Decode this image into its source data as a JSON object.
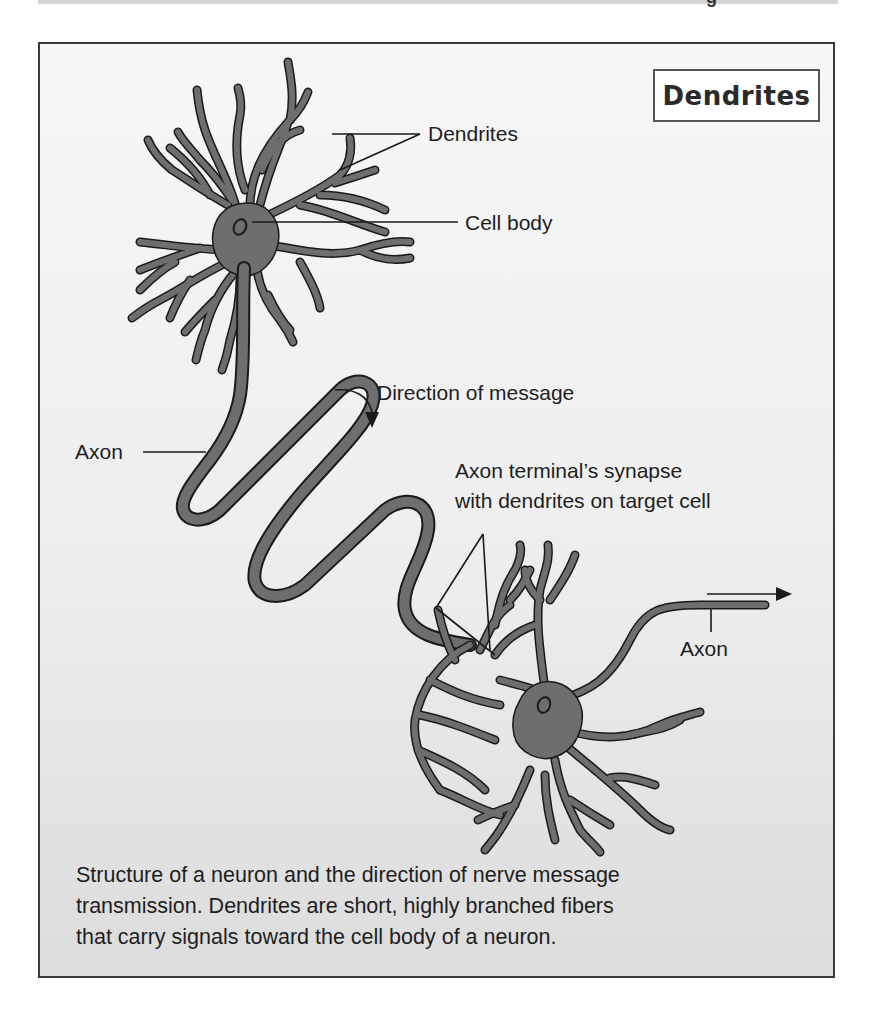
{
  "header": {
    "top_strip_glyph": "g"
  },
  "figure": {
    "title": "Dendrites",
    "labels": {
      "dendrites": "Dendrites",
      "cell_body": "Cell body",
      "direction": "Direction of message",
      "axon_left": "Axon",
      "synapse_line1": "Axon terminal’s synapse",
      "synapse_line2": "with dendrites on target cell",
      "axon_right": "Axon"
    },
    "caption": {
      "lines": [
        "Structure of a neuron and the direction of nerve message",
        "transmission.  Dendrites are short, highly branched fibers",
        "that carry signals toward the cell body of a neuron."
      ]
    },
    "colors": {
      "neuron_fill": "#6e6e6e",
      "neuron_outline": "#1a1a1a",
      "frame_border": "#3a3a3a",
      "background_top": "#f7f7f7",
      "background_bottom": "#dcdcdc"
    }
  }
}
